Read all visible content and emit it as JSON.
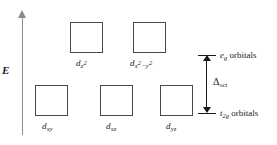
{
  "diagram": {
    "axis": {
      "label": "E",
      "name": "energy-axis",
      "direction": "up"
    },
    "upper_set": {
      "term": "e",
      "term_sub": "g",
      "suffix": " orbitals",
      "orbitals": [
        {
          "base": "d",
          "sub": "z",
          "sup": "2",
          "full": "dz2"
        },
        {
          "base": "d",
          "sub": "x",
          "sup": "2",
          "sub2": "−y",
          "sup2": "2",
          "full": "dx2-y2"
        }
      ]
    },
    "lower_set": {
      "term": "t",
      "term_sub": "2g",
      "suffix": " orbitals",
      "orbitals": [
        {
          "base": "d",
          "sub": "xy",
          "full": "dxy"
        },
        {
          "base": "d",
          "sub": "xz",
          "full": "dxz"
        },
        {
          "base": "d",
          "sub": "yz",
          "full": "dyz"
        }
      ]
    },
    "splitting": {
      "symbol": "Δ",
      "subscript": "oct",
      "name": "delta-oct"
    },
    "colors": {
      "box_border": "#4a4a4a",
      "axis": "#8c8c8c",
      "text": "#1a1a1a",
      "background": "#ffffff"
    }
  }
}
